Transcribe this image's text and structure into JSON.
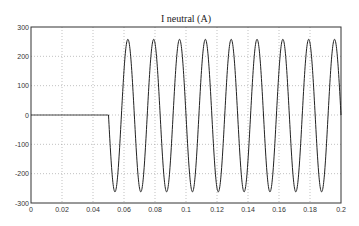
{
  "chart_data": {
    "type": "line",
    "title": "I neutral (A)",
    "xlabel": "",
    "ylabel": "",
    "xlim": [
      0,
      0.2
    ],
    "ylim": [
      -300,
      300
    ],
    "xticks": [
      0,
      0.02,
      0.04,
      0.06,
      0.08,
      0.1,
      0.12,
      0.14,
      0.16,
      0.18,
      0.2
    ],
    "xtick_labels": [
      "0",
      "0.02",
      "0.04",
      "0.06",
      "0.08",
      "0.1",
      "0.12",
      "0.14",
      "0.16",
      "0.18",
      "0.2"
    ],
    "yticks": [
      -300,
      -200,
      -100,
      0,
      100,
      200,
      300
    ],
    "ytick_labels": [
      "-300",
      "-200",
      "-100",
      "0",
      "100",
      "200",
      "300"
    ],
    "grid": true,
    "legend": null,
    "series": [
      {
        "name": "I neutral",
        "description": "Zero until t=0.05 s, then sinusoid ~60 Hz, amplitude ~260 A starting downward",
        "onset_time": 0.05,
        "frequency_hz": 60,
        "amplitude": 260,
        "troughs_x": [
          0.0545,
          0.0712,
          0.0878,
          0.1045,
          0.1212,
          0.1378,
          0.1545,
          0.1712,
          0.1878
        ],
        "peaks_x": [
          0.0628,
          0.0795,
          0.0962,
          0.1128,
          0.1295,
          0.1462,
          0.1628,
          0.1795,
          0.1962
        ],
        "peak_value": 258,
        "trough_value": -262,
        "end_value": 100
      }
    ]
  }
}
